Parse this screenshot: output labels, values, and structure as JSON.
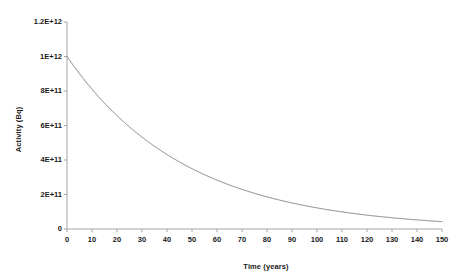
{
  "chart_data": {
    "type": "line",
    "title": "",
    "xlabel": "Time (years)",
    "ylabel": "Activity (Bq)",
    "xlim": [
      0,
      150
    ],
    "ylim": [
      0,
      1200000000000.0
    ],
    "xticks": [
      0,
      10,
      20,
      30,
      40,
      50,
      60,
      70,
      80,
      90,
      100,
      110,
      120,
      130,
      140,
      150
    ],
    "xtick_labels": [
      "0",
      "10",
      "20",
      "30",
      "40",
      "50",
      "60",
      "70",
      "80",
      "90",
      "100",
      "110",
      "120",
      "130",
      "140",
      "150"
    ],
    "yticks": [
      0,
      200000000000.0,
      400000000000.0,
      600000000000.0,
      800000000000.0,
      1000000000000.0,
      1200000000000.0
    ],
    "ytick_labels": [
      "0",
      "2E+11",
      "4E+11",
      "6E+11",
      "8E+11",
      "1E+12",
      "1.2E+12"
    ],
    "grid": false,
    "legend": false,
    "line_color": "#808080",
    "axis_color": "#a6a6a6",
    "text_color": "#1a1a1a",
    "series": [
      {
        "name": "Activity",
        "decay_initial": 1000000000000.0,
        "half_life_years": 33,
        "x": [
          0,
          5,
          10,
          15,
          20,
          25,
          30,
          35,
          40,
          45,
          50,
          55,
          60,
          65,
          70,
          75,
          80,
          85,
          90,
          95,
          100,
          105,
          110,
          115,
          120,
          125,
          130,
          135,
          140,
          145,
          150
        ],
        "values": [
          1000000000000.0,
          900000000000.0,
          810000000000.0,
          729000000000.0,
          656000000000.0,
          590500000000.0,
          531500000000.0,
          478300000000.0,
          430500000000.0,
          387400000000.0,
          348700000000.0,
          313800000000.0,
          282400000000.0,
          254200000000.0,
          228800000000.0,
          205900000000.0,
          185300000000.0,
          166800000000.0,
          150100000000.0,
          135100000000.0,
          121600000000.0,
          109400000000.0,
          98480000000.0,
          88630000000.0,
          79770000000.0,
          71790000000.0,
          64610000000.0,
          58150000000.0,
          52340000000.0,
          47100000000.0,
          42390000000.0
        ]
      }
    ]
  }
}
